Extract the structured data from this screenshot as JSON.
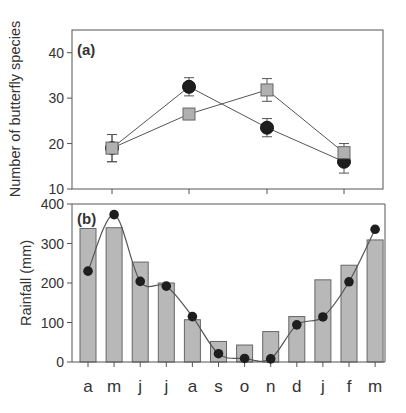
{
  "figure": {
    "panel_a_label": "(a)",
    "panel_b_label": "(b)",
    "panel_a_ylabel": "Number of butterfly species",
    "panel_b_ylabel": "Rainfall (mm)"
  },
  "colors": {
    "axis": "#555555",
    "text": "#333333",
    "bar_fill": "#b8b8b8",
    "bar_stroke": "#666666",
    "circle_fill": "#1e1e1e",
    "square_fill": "#b0b0b0",
    "square_stroke": "#666666",
    "line": "#555555"
  },
  "chart_data": [
    {
      "panel": "(a)",
      "type": "line",
      "title": "",
      "xlabel": "",
      "ylabel": "Number of butterfly species",
      "ylim": [
        10,
        45
      ],
      "yticks": [
        10,
        20,
        30,
        40
      ],
      "x_positions": [
        1,
        2,
        3,
        4
      ],
      "x_tick_labels": [
        "",
        "",
        "",
        ""
      ],
      "grid": false,
      "legend": null,
      "series": [
        {
          "name": "circles",
          "marker": "circle",
          "values": [
            19,
            32.5,
            23.5,
            16
          ],
          "errors": [
            3,
            2,
            2,
            2.5
          ]
        },
        {
          "name": "squares",
          "marker": "square",
          "values": [
            19,
            26.5,
            31.8,
            18
          ],
          "errors": [
            3,
            1,
            2.5,
            2
          ]
        }
      ]
    },
    {
      "panel": "(b)",
      "type": "bar",
      "title": "",
      "xlabel": "",
      "ylabel": "Rainfall (mm)",
      "ylim": [
        0,
        400
      ],
      "yticks": [
        0,
        100,
        200,
        300,
        400
      ],
      "grid": false,
      "legend": null,
      "categories": [
        "a",
        "m",
        "j",
        "j",
        "a",
        "s",
        "o",
        "n",
        "d",
        "j",
        "f",
        "m"
      ],
      "series": [
        {
          "name": "bars",
          "type": "bar",
          "values": [
            338,
            340,
            253,
            200,
            107,
            52,
            43,
            77,
            115,
            208,
            245,
            309
          ]
        },
        {
          "name": "line",
          "type": "line",
          "marker": "circle",
          "smooth": true,
          "values": [
            230,
            373,
            204,
            192,
            115,
            21,
            9,
            8,
            94,
            114,
            203,
            336
          ]
        }
      ]
    }
  ]
}
